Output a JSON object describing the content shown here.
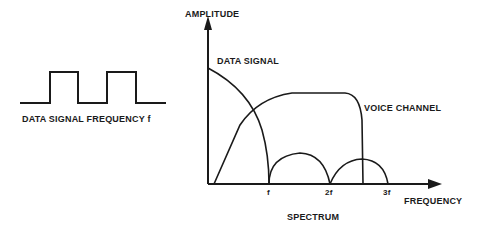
{
  "left_figure": {
    "caption": "DATA SIGNAL FREQUENCY f",
    "waveform": "square-wave"
  },
  "spectrum": {
    "y_axis_label": "AMPLITUDE",
    "x_axis_label": "FREQUENCY",
    "caption": "SPECTRUM",
    "ticks": [
      "f",
      "2f",
      "3f"
    ],
    "curve_labels": {
      "data_signal": "DATA SIGNAL",
      "voice_channel": "VOICE CHANNEL"
    }
  },
  "colors": {
    "ink": "#1a1a1a",
    "background": "#ffffff"
  }
}
